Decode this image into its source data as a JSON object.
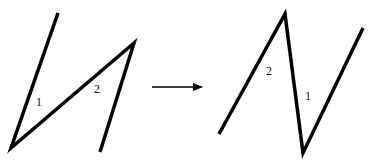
{
  "diagram": {
    "left_figure": {
      "polyline": [
        [
          58,
          13
        ],
        [
          11,
          148
        ],
        [
          134,
          43
        ],
        [
          100,
          152
        ]
      ],
      "labels": [
        {
          "text": "1",
          "x": 36,
          "y": 106
        },
        {
          "text": "2",
          "x": 94,
          "y": 93
        }
      ]
    },
    "arrow": {
      "from": [
        152,
        87
      ],
      "to": [
        202,
        87
      ]
    },
    "right_figure": {
      "polyline": [
        [
          219,
          134
        ],
        [
          285,
          14
        ],
        [
          303,
          153
        ],
        [
          363,
          28
        ]
      ],
      "labels": [
        {
          "text": "2",
          "x": 266,
          "y": 75
        },
        {
          "text": "1",
          "x": 305,
          "y": 100
        }
      ]
    },
    "stroke_color": "#000000"
  }
}
